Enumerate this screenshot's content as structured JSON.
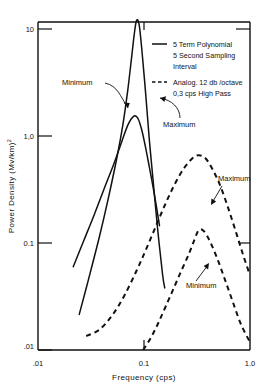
{
  "chart_data": {
    "type": "line",
    "title": "",
    "xlabel": "Frequency  (cps)",
    "ylabel": "Power Density  (Mv/km)2",
    "ylabel_base": "Power Density  (Mv/km)",
    "ylabel_exponent": "2",
    "xscale": "log",
    "yscale": "log",
    "xlim": [
      0.01,
      1.0
    ],
    "ylim": [
      0.01,
      20
    ],
    "grid": false,
    "xticks": [
      0.01,
      0.1,
      1.0
    ],
    "xticklabels": [
      ".01",
      "0.1",
      "1.0"
    ],
    "yticks": [
      0.01,
      0.1,
      1.0,
      10
    ],
    "yticklabels": [
      ".01",
      "0.1",
      "1,0",
      "10"
    ],
    "legend_position": "upper-right-inside",
    "series": [
      {
        "name": "5 Term Polynomial Maximum",
        "style": "solid",
        "label": "Maximum",
        "peak_x": 0.085,
        "peak_y": 12.0,
        "points": [
          [
            0.0245,
            0.0215
          ],
          [
            0.03,
            0.046
          ],
          [
            0.038,
            0.115
          ],
          [
            0.046,
            0.26
          ],
          [
            0.055,
            0.6
          ],
          [
            0.063,
            1.25
          ],
          [
            0.07,
            2.6
          ],
          [
            0.076,
            5.2
          ],
          [
            0.081,
            9.0
          ],
          [
            0.085,
            12.0
          ],
          [
            0.09,
            11.0
          ],
          [
            0.096,
            6.0
          ],
          [
            0.104,
            2.4
          ],
          [
            0.112,
            0.95
          ],
          [
            0.122,
            0.38
          ],
          [
            0.135,
            0.13
          ],
          [
            0.15,
            0.05
          ],
          [
            0.157,
            0.038
          ]
        ]
      },
      {
        "name": "5 Term Polynomial Minimum",
        "style": "solid",
        "label": "Minimum",
        "peak_x": 0.082,
        "peak_y": 1.55,
        "points": [
          [
            0.0215,
            0.06
          ],
          [
            0.027,
            0.105
          ],
          [
            0.034,
            0.185
          ],
          [
            0.042,
            0.32
          ],
          [
            0.052,
            0.55
          ],
          [
            0.062,
            0.9
          ],
          [
            0.07,
            1.25
          ],
          [
            0.076,
            1.45
          ],
          [
            0.082,
            1.55
          ],
          [
            0.088,
            1.45
          ],
          [
            0.095,
            1.15
          ],
          [
            0.103,
            0.8
          ],
          [
            0.112,
            0.52
          ],
          [
            0.122,
            0.33
          ],
          [
            0.132,
            0.21
          ],
          [
            0.14,
            0.145
          ]
        ]
      },
      {
        "name": "Analog 12 db/octave Maximum",
        "style": "dashed",
        "label": "Maximum",
        "peak_x": 0.33,
        "peak_y": 0.66,
        "points": [
          [
            0.0285,
            0.0135
          ],
          [
            0.038,
            0.0155
          ],
          [
            0.05,
            0.021
          ],
          [
            0.065,
            0.032
          ],
          [
            0.085,
            0.055
          ],
          [
            0.105,
            0.088
          ],
          [
            0.13,
            0.145
          ],
          [
            0.16,
            0.235
          ],
          [
            0.195,
            0.355
          ],
          [
            0.24,
            0.505
          ],
          [
            0.29,
            0.625
          ],
          [
            0.33,
            0.66
          ],
          [
            0.38,
            0.62
          ],
          [
            0.44,
            0.495
          ],
          [
            0.52,
            0.35
          ],
          [
            0.62,
            0.215
          ],
          [
            0.74,
            0.125
          ],
          [
            0.87,
            0.075
          ],
          [
            1.0,
            0.05
          ]
        ]
      },
      {
        "name": "Analog 12 db/octave Minimum",
        "style": "dashed",
        "label": "Minimum",
        "peak_x": 0.33,
        "peak_y": 0.133,
        "points": [
          [
            0.098,
            0.01
          ],
          [
            0.115,
            0.0128
          ],
          [
            0.135,
            0.0175
          ],
          [
            0.16,
            0.0255
          ],
          [
            0.19,
            0.0375
          ],
          [
            0.225,
            0.055
          ],
          [
            0.265,
            0.079
          ],
          [
            0.3,
            0.108
          ],
          [
            0.33,
            0.133
          ],
          [
            0.37,
            0.128
          ],
          [
            0.42,
            0.103
          ],
          [
            0.49,
            0.072
          ],
          [
            0.58,
            0.0455
          ],
          [
            0.69,
            0.028
          ],
          [
            0.82,
            0.0175
          ],
          [
            1.0,
            0.0118
          ]
        ]
      }
    ],
    "annotations": [
      {
        "text": "Minimum",
        "role": "solid-minimum-label"
      },
      {
        "text": "Maximum",
        "role": "solid-maximum-label"
      },
      {
        "text": "Maximum",
        "role": "dashed-maximum-label"
      },
      {
        "text": "Minimum",
        "role": "dashed-minimum-label"
      }
    ]
  },
  "legend": {
    "entries": [
      {
        "style": "solid",
        "line1": "5 Term Polynomial",
        "line2": "5 Second Sampling",
        "line3": "Interval"
      },
      {
        "style": "dashed",
        "line1": "Analog. 12 db /octave",
        "line2": "0,3 cps High Pass",
        "line3": ""
      }
    ]
  }
}
